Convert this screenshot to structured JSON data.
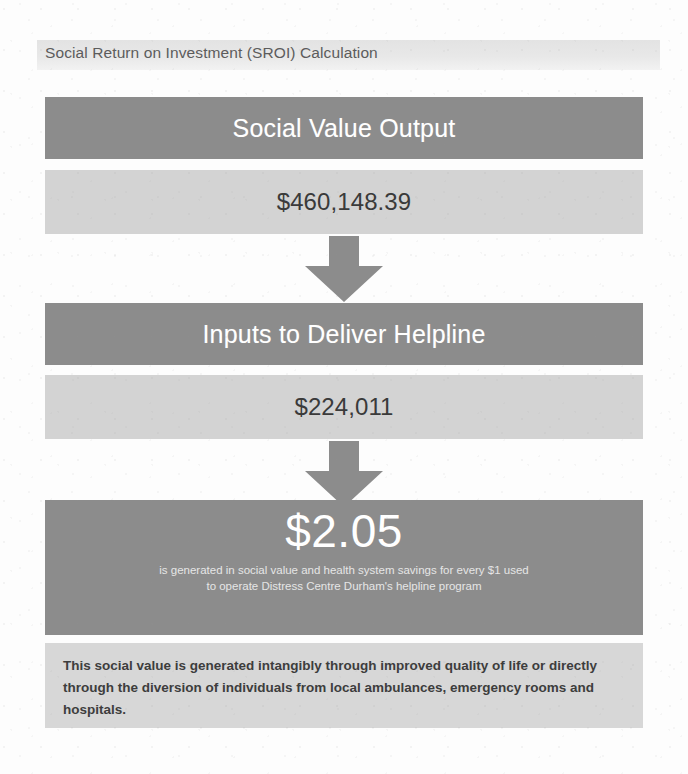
{
  "header": {
    "title": "Social Return on Investment (SROI) Calculation"
  },
  "flow": {
    "stages": [
      {
        "label": "Social Value Output",
        "value": "$460,148.39"
      },
      {
        "label": "Inputs to Deliver Helpline",
        "value": "$224,011"
      }
    ],
    "arrow_icon": "arrow-down-icon",
    "result": {
      "figure": "$2.05",
      "caption_line_1": "is generated in social value and health system savings for every $1 used",
      "caption_line_2": "to operate Distress Centre Durham's helpline program"
    },
    "note": "This social value is generated intangibly through improved quality of life or directly through the diversion of individuals from local ambulances, emergency rooms and hospitals."
  },
  "colors": {
    "band_dark": "#8c8c8c",
    "band_light": "#d3d3d3",
    "note_bg": "#d7d7d7",
    "header_bg": "#e8e8e8",
    "arrow": "#8c8c8c",
    "text_light": "#ffffff",
    "text_dark": "#3a3a3a"
  }
}
